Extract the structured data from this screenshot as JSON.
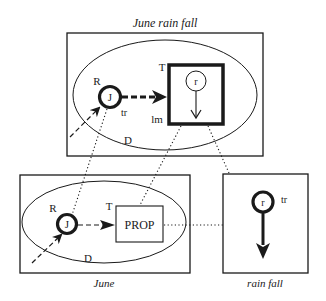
{
  "diagram": {
    "top_panel": {
      "title": "June rain fall",
      "ellipse_label": "D",
      "entity": {
        "label": "J",
        "role_label": "R",
        "trace_label": "tr"
      },
      "region": {
        "top_label": "T",
        "bottom_label": "lm",
        "inner_entity": "r"
      }
    },
    "bottom_left_panel": {
      "title": "June",
      "ellipse_label": "D",
      "entity": {
        "label": "J",
        "role_label": "R"
      },
      "prop": {
        "label": "PROP",
        "top_label": "T"
      }
    },
    "bottom_right_panel": {
      "title": "rain fall",
      "entity": {
        "label": "r",
        "trace_label": "tr"
      }
    },
    "colors": {
      "stroke": "#1a1a1a",
      "background": "#ffffff"
    }
  }
}
